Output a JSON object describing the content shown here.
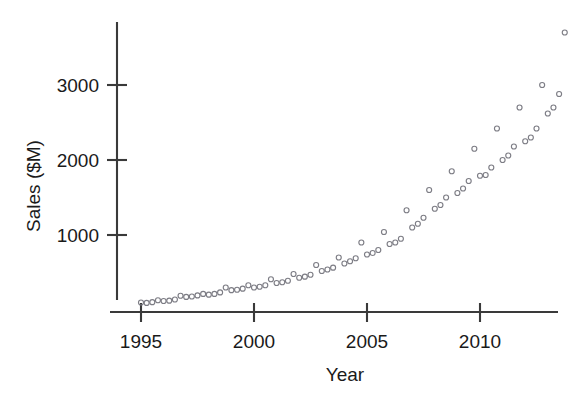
{
  "chart_data": {
    "type": "scatter",
    "title": "",
    "xlabel": "Year",
    "ylabel": "Sales ($M)",
    "xlim": [
      1994.5,
      2014.3
    ],
    "ylim": [
      0,
      3900
    ],
    "xticks": [
      1995,
      2000,
      2005,
      2010
    ],
    "xtick_labels": [
      "1995",
      "2000",
      "2005",
      "2010"
    ],
    "yticks": [
      1000,
      2000,
      3000
    ],
    "ytick_labels": [
      "1000",
      "2000",
      "3000"
    ],
    "grid": false,
    "legend": "none",
    "marker": "open-circle",
    "marker_color": "#7d7d85",
    "marker_size": 5,
    "series": [
      {
        "name": "Quarterly Sales",
        "x": [
          1995.0,
          1995.25,
          1995.5,
          1995.75,
          1996.0,
          1996.25,
          1996.5,
          1996.75,
          1997.0,
          1997.25,
          1997.5,
          1997.75,
          1998.0,
          1998.25,
          1998.5,
          1998.75,
          1999.0,
          1999.25,
          1999.5,
          1999.75,
          2000.0,
          2000.25,
          2000.5,
          2000.75,
          2001.0,
          2001.25,
          2001.5,
          2001.75,
          2002.0,
          2002.25,
          2002.5,
          2002.75,
          2003.0,
          2003.25,
          2003.5,
          2003.75,
          2004.0,
          2004.25,
          2004.5,
          2004.75,
          2005.0,
          2005.25,
          2005.5,
          2005.75,
          2006.0,
          2006.25,
          2006.5,
          2006.75,
          2007.0,
          2007.25,
          2007.5,
          2007.75,
          2008.0,
          2008.25,
          2008.5,
          2008.75,
          2009.0,
          2009.25,
          2009.5,
          2009.75,
          2010.0,
          2010.25,
          2010.5,
          2010.75,
          2011.0,
          2011.25,
          2011.5,
          2011.75,
          2012.0,
          2012.25,
          2012.5,
          2012.75,
          2013.0,
          2013.25,
          2013.5,
          2013.75
        ],
        "y": [
          100,
          95,
          105,
          130,
          120,
          125,
          140,
          190,
          175,
          180,
          195,
          215,
          205,
          215,
          235,
          300,
          265,
          270,
          285,
          330,
          300,
          310,
          330,
          410,
          360,
          370,
          390,
          480,
          430,
          445,
          470,
          600,
          520,
          540,
          565,
          700,
          620,
          650,
          690,
          900,
          740,
          760,
          800,
          1040,
          880,
          900,
          950,
          1330,
          1100,
          1150,
          1230,
          1600,
          1350,
          1400,
          1500,
          1850,
          1560,
          1620,
          1720,
          2150,
          1790,
          1800,
          1900,
          2420,
          2000,
          2060,
          2180,
          2700,
          2250,
          2300,
          2420,
          3000,
          2620,
          2700,
          2880,
          3700
        ]
      }
    ],
    "annotations": [
      {
        "text": "Highest observed value near 3700 at 2013 Q4"
      },
      {
        "text": "Seasonal Q4 peaks visible each year"
      },
      {
        "text": "Exponential growth trend 1995-2013"
      }
    ]
  },
  "axes": {
    "y_axis_label": "Sales ($M)",
    "x_axis_label": "Year"
  }
}
